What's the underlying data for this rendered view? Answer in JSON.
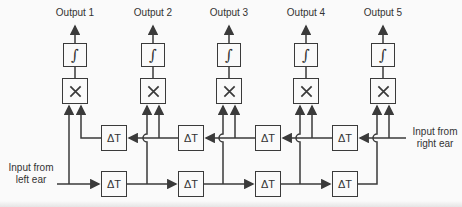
{
  "diagram": {
    "outputs": [
      "Output 1",
      "Output 2",
      "Output 3",
      "Output 4",
      "Output 5"
    ],
    "integrators": [
      "∫",
      "∫",
      "∫",
      "∫",
      "∫"
    ],
    "multipliers": [
      "×",
      "×",
      "×",
      "×",
      "×"
    ],
    "delays_top": [
      "ΔT",
      "ΔT",
      "ΔT",
      "ΔT"
    ],
    "delays_bottom": [
      "ΔT",
      "ΔT",
      "ΔT",
      "ΔT"
    ],
    "input_left": {
      "line1": "Input from",
      "line2": "left ear"
    },
    "input_right": {
      "line1": "Input from",
      "line2": "right ear"
    },
    "colors": {
      "line": "#3a3a3a",
      "text": "#333333",
      "background": "#fafafa"
    }
  }
}
